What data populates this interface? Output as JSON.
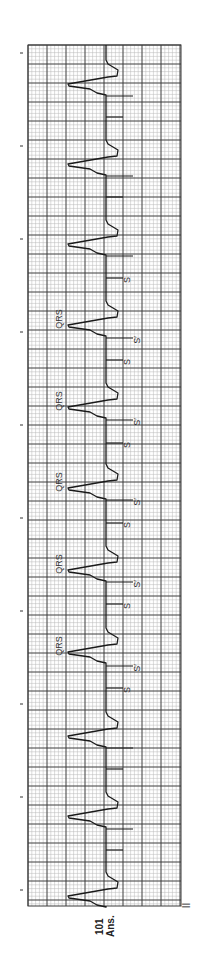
{
  "figure": {
    "lead_label": "II",
    "caption_number": "101",
    "caption_text": "Ans."
  },
  "grid": {
    "left": 28,
    "right": 181,
    "top": 45,
    "bottom": 906,
    "minor_step": 3.8,
    "major_step": 19,
    "minor_color": "#b8b8b8",
    "major_color": "#3a3a3a",
    "trace_color": "#1a1a1a"
  },
  "tick_marks_y": [
    53,
    146,
    239,
    332,
    425,
    518,
    611,
    704,
    797,
    890
  ],
  "baseline_x": 106,
  "beats": [
    {
      "qrs_y": 86,
      "long_tick_y": 96,
      "short_tick_y": 117,
      "labels": []
    },
    {
      "qrs_y": 166,
      "long_tick_y": 176,
      "short_tick_y": 197,
      "labels": []
    },
    {
      "qrs_y": 246,
      "long_tick_y": 256,
      "short_tick_y": 278,
      "labels": [
        "S"
      ]
    },
    {
      "qrs_y": 327,
      "long_tick_y": 338,
      "short_tick_y": 360,
      "labels": [
        "QRS",
        "S′",
        "S"
      ]
    },
    {
      "qrs_y": 409,
      "long_tick_y": 420,
      "short_tick_y": 443,
      "labels": [
        "QRS",
        "S′",
        "S"
      ]
    },
    {
      "qrs_y": 490,
      "long_tick_y": 500,
      "short_tick_y": 523,
      "labels": [
        "QRS",
        "S′",
        "S"
      ]
    },
    {
      "qrs_y": 572,
      "long_tick_y": 582,
      "short_tick_y": 604,
      "labels": [
        "QRS",
        "S′",
        "S"
      ]
    },
    {
      "qrs_y": 654,
      "long_tick_y": 666,
      "short_tick_y": 688,
      "labels": [
        "QRS",
        "S′",
        "S"
      ]
    },
    {
      "qrs_y": 738,
      "long_tick_y": 748,
      "short_tick_y": 769,
      "labels": []
    },
    {
      "qrs_y": 818,
      "long_tick_y": 829,
      "short_tick_y": 850,
      "labels": []
    },
    {
      "qrs_y": 898,
      "long_tick_y": null,
      "short_tick_y": null,
      "labels": []
    }
  ],
  "annotation_text": {
    "qrs": "QRS",
    "s_prime": "S′",
    "s": "S"
  }
}
